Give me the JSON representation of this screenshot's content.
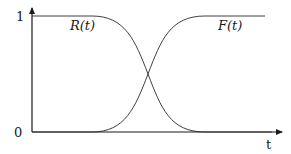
{
  "chart_data": {
    "type": "line",
    "title": "",
    "xlabel": "t",
    "ylabel": "",
    "y_ticks": [
      "0",
      "1"
    ],
    "ylim": [
      0,
      1
    ],
    "grid": false,
    "legend": "inline curve labels",
    "series": [
      {
        "name": "R(t)",
        "description": "reliability, decreasing S-curve from 1 to 0",
        "x": [
          0,
          0.2,
          0.35,
          0.45,
          0.5,
          0.55,
          0.65,
          0.8,
          1.0
        ],
        "values": [
          1,
          1,
          0.97,
          0.75,
          0.5,
          0.25,
          0.03,
          0,
          0
        ]
      },
      {
        "name": "F(t)",
        "description": "unreliability, increasing S-curve from 0 to 1",
        "x": [
          0,
          0.2,
          0.35,
          0.45,
          0.5,
          0.55,
          0.65,
          0.8,
          1.0
        ],
        "values": [
          0,
          0,
          0.03,
          0.25,
          0.5,
          0.75,
          0.97,
          1,
          1
        ]
      }
    ],
    "annotations": [
      "curves intersect at 0.5"
    ]
  },
  "labels": {
    "y_one": "1",
    "y_zero": "0",
    "x_axis": "t",
    "r_label": "R(t)",
    "f_label": "F(t)"
  }
}
